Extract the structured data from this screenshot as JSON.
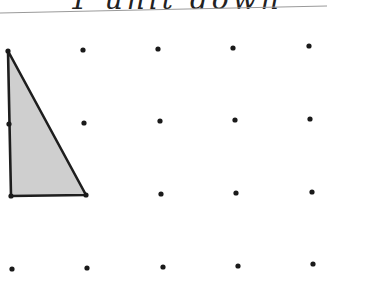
{
  "header": {
    "caption": "1 unit down",
    "rule": {
      "x1": 0,
      "y1": 13,
      "x2": 327,
      "y2": 6,
      "color": "#9a9a9a"
    }
  },
  "grid": {
    "dot_color": "#1a1a1a",
    "dot_radius": 2.6,
    "dots": [
      [
        8,
        51
      ],
      [
        83,
        50
      ],
      [
        158,
        49
      ],
      [
        233,
        48
      ],
      [
        309,
        46
      ],
      [
        9,
        124
      ],
      [
        84,
        123
      ],
      [
        160,
        121
      ],
      [
        235,
        120
      ],
      [
        310,
        119
      ],
      [
        11,
        196
      ],
      [
        86,
        195
      ],
      [
        161,
        194
      ],
      [
        236,
        193
      ],
      [
        312,
        192
      ],
      [
        12,
        269
      ],
      [
        87,
        268
      ],
      [
        163,
        267
      ],
      [
        238,
        266
      ],
      [
        313,
        264
      ]
    ]
  },
  "shape": {
    "type": "right-triangle",
    "vertices": [
      [
        8,
        51
      ],
      [
        11,
        196
      ],
      [
        86,
        195
      ]
    ],
    "fill": "#cfcfcf",
    "stroke": "#1e1e1e",
    "stroke_width": 2.6
  }
}
